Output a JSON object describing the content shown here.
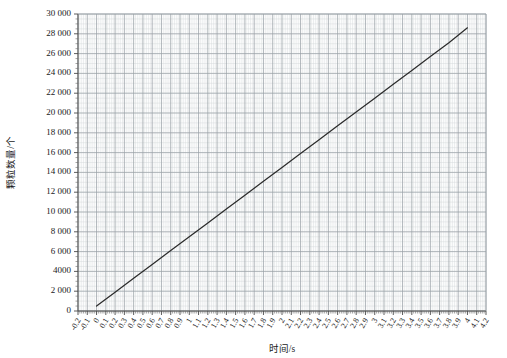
{
  "chart_data": {
    "type": "line",
    "title": "",
    "xlabel": "时间/s",
    "ylabel": "颗粒数量/个",
    "xlim": [
      -0.2,
      4.2
    ],
    "ylim": [
      0,
      30000
    ],
    "grid": true,
    "legend": null,
    "x_tick_step": 0.1,
    "y_tick_step": 2000,
    "x_minor_per_major": 5,
    "y_minor_per_major": 4,
    "y_ticks": [
      "0",
      "2 000",
      "4000",
      "6 000",
      "8 000",
      "10 000",
      "12 000",
      "14 000",
      "16 000",
      "18 000",
      "20 000",
      "22 000",
      "24 000",
      "26 000",
      "28 000",
      "30 000"
    ],
    "y_tick_values": [
      0,
      2000,
      4000,
      6000,
      8000,
      10000,
      12000,
      14000,
      16000,
      18000,
      20000,
      22000,
      24000,
      26000,
      28000,
      30000
    ],
    "x_ticks": [
      "-0.2",
      "-0.1",
      "0",
      "0.1",
      "0.2",
      "0.3",
      "0.4",
      "0.5",
      "0.6",
      "0.7",
      "0.8",
      "0.9",
      "1",
      "1.1",
      "1.2",
      "1.3",
      "1.4",
      "1.5",
      "1.6",
      "1.7",
      "1.8",
      "1.9",
      "2",
      "2.1",
      "2.2",
      "2.3",
      "2.4",
      "2.5",
      "2.6",
      "2.7",
      "2.8",
      "2.9",
      "3",
      "3.1",
      "3.2",
      "3.3",
      "3.4",
      "3.5",
      "3.6",
      "3.7",
      "3.8",
      "3.9",
      "4",
      "4.1",
      "4.2"
    ],
    "x_tick_values": [
      -0.2,
      -0.1,
      0,
      0.1,
      0.2,
      0.3,
      0.4,
      0.5,
      0.6,
      0.7,
      0.8,
      0.9,
      1,
      1.1,
      1.2,
      1.3,
      1.4,
      1.5,
      1.6,
      1.7,
      1.8,
      1.9,
      2,
      2.1,
      2.2,
      2.3,
      2.4,
      2.5,
      2.6,
      2.7,
      2.8,
      2.9,
      3,
      3.1,
      3.2,
      3.3,
      3.4,
      3.5,
      3.6,
      3.7,
      3.8,
      3.9,
      4,
      4.1,
      4.2
    ],
    "series": [
      {
        "name": "颗粒数量",
        "color": "#2b2b2b",
        "x": [
          0.0,
          0.2,
          0.4,
          0.6,
          0.8,
          1.0,
          1.2,
          1.4,
          1.6,
          1.8,
          2.0,
          2.2,
          2.4,
          2.6,
          2.8,
          3.0,
          3.2,
          3.4,
          3.6,
          3.8,
          4.0
        ],
        "values": [
          500,
          1900,
          3300,
          4700,
          6100,
          7500,
          8900,
          10300,
          11700,
          13100,
          14500,
          15900,
          17300,
          18700,
          20100,
          21500,
          22900,
          24300,
          25700,
          27100,
          28600
        ]
      }
    ]
  },
  "colors": {
    "grid_major": "#9aa0a6",
    "grid_minor": "#d3d6da",
    "axis": "#4a4a4a",
    "line": "#2b2b2b",
    "background": "#ffffff"
  }
}
